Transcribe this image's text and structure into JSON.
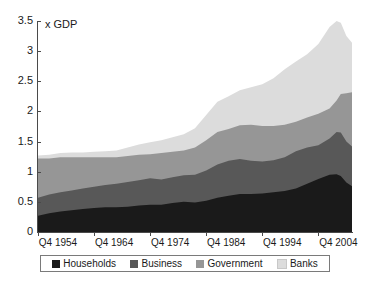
{
  "chart_data": {
    "type": "area",
    "title": "",
    "subtitle": "",
    "unit_label": "x GDP",
    "xlabel": "",
    "ylabel": "",
    "stacked": true,
    "grid": false,
    "legend_position": "bottom",
    "ylim": [
      0,
      3.5
    ],
    "ytick_labels": [
      "3.5",
      "3",
      "2.5",
      "2",
      "1.5",
      "1",
      "0.5",
      "0"
    ],
    "ytick_values": [
      3.5,
      3,
      2.5,
      2,
      1.5,
      1,
      0.5,
      0
    ],
    "xtick_labels": [
      "Q4 1954",
      "Q4 1964",
      "Q4 1974",
      "Q4 1984",
      "Q4 1994",
      "Q4 2004"
    ],
    "xtick_values": [
      1954.75,
      1964.75,
      1974.75,
      1984.75,
      1994.75,
      2004.75
    ],
    "xlim": [
      1954.75,
      2010.75
    ],
    "colors": {
      "households": "#1a1a1a",
      "business": "#585858",
      "government": "#969696",
      "banks": "#dcdcdc"
    },
    "x": [
      1954.75,
      1956.75,
      1958.75,
      1960.75,
      1962.75,
      1964.75,
      1966.75,
      1968.75,
      1970.75,
      1972.75,
      1974.75,
      1976.75,
      1978.75,
      1980.75,
      1982.75,
      1984.75,
      1986.75,
      1988.75,
      1990.75,
      1992.75,
      1994.75,
      1996.75,
      1998.75,
      2000.75,
      2002.75,
      2004.75,
      2006.75,
      2008.0,
      2008.75,
      2009.75,
      2010.75
    ],
    "series": [
      {
        "name": "Households",
        "color": "#1a1a1a",
        "values": [
          0.27,
          0.31,
          0.34,
          0.36,
          0.38,
          0.4,
          0.41,
          0.41,
          0.42,
          0.44,
          0.45,
          0.45,
          0.48,
          0.5,
          0.49,
          0.52,
          0.57,
          0.6,
          0.63,
          0.63,
          0.64,
          0.66,
          0.68,
          0.72,
          0.8,
          0.88,
          0.95,
          0.96,
          0.93,
          0.82,
          0.76
        ]
      },
      {
        "name": "Business",
        "color": "#585858",
        "values": [
          0.3,
          0.31,
          0.32,
          0.33,
          0.34,
          0.35,
          0.37,
          0.39,
          0.41,
          0.42,
          0.44,
          0.42,
          0.43,
          0.44,
          0.46,
          0.5,
          0.55,
          0.58,
          0.58,
          0.55,
          0.53,
          0.53,
          0.56,
          0.62,
          0.6,
          0.56,
          0.6,
          0.7,
          0.72,
          0.68,
          0.66
        ]
      },
      {
        "name": "Government",
        "color": "#969696",
        "values": [
          0.65,
          0.6,
          0.58,
          0.55,
          0.52,
          0.49,
          0.46,
          0.44,
          0.43,
          0.42,
          0.4,
          0.44,
          0.42,
          0.41,
          0.45,
          0.5,
          0.54,
          0.53,
          0.56,
          0.6,
          0.59,
          0.57,
          0.54,
          0.49,
          0.5,
          0.52,
          0.5,
          0.52,
          0.64,
          0.8,
          0.9
        ]
      },
      {
        "name": "Banks",
        "color": "#dcdcdc",
        "values": [
          0.05,
          0.06,
          0.07,
          0.08,
          0.08,
          0.09,
          0.1,
          0.11,
          0.14,
          0.17,
          0.2,
          0.21,
          0.24,
          0.27,
          0.32,
          0.42,
          0.5,
          0.54,
          0.58,
          0.62,
          0.69,
          0.79,
          0.92,
          1.0,
          1.05,
          1.16,
          1.35,
          1.32,
          1.18,
          0.95,
          0.82
        ]
      }
    ]
  },
  "legend": {
    "items": [
      {
        "label": "Households",
        "color": "#1a1a1a"
      },
      {
        "label": "Business",
        "color": "#585858"
      },
      {
        "label": "Government",
        "color": "#969696"
      },
      {
        "label": "Banks",
        "color": "#dcdcdc"
      }
    ]
  },
  "axes": {
    "y": {
      "labels": [
        "3.5",
        "3",
        "2.5",
        "2",
        "1.5",
        "1",
        "0.5",
        "0"
      ]
    },
    "x": {
      "labels": [
        "Q4 1954",
        "Q4 1964",
        "Q4 1974",
        "Q4 1984",
        "Q4 1994",
        "Q4 2004"
      ]
    },
    "unit_label": "x GDP"
  }
}
